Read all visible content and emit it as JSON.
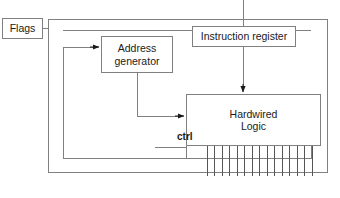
{
  "diagram": {
    "background_color": "#ffffff",
    "line_color": "#808080",
    "arrow_color": "#1a1a1a",
    "text_color": "#1a1a1a",
    "nodes": {
      "flags": {
        "label": "Flags"
      },
      "address_generator": {
        "line1": "Address",
        "line2": "generator"
      },
      "instruction_register": {
        "label": "Instruction register"
      },
      "hardwired_logic": {
        "line1": "Hardwired",
        "line2": "Logic"
      }
    },
    "labels": {
      "ctrl": "ctrl"
    },
    "control_bus": {
      "line_count": 15,
      "spacing_px": 7.5
    }
  }
}
